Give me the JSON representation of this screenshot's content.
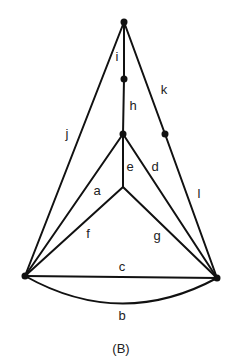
{
  "caption": "(B)",
  "nodes": {
    "top": {
      "x": 124,
      "y": 22,
      "dot": true
    },
    "ih": {
      "x": 124,
      "y": 79,
      "dot": true
    },
    "mid": {
      "x": 123,
      "y": 134,
      "dot": true
    },
    "kl": {
      "x": 165,
      "y": 134,
      "dot": true
    },
    "center": {
      "x": 123,
      "y": 187,
      "dot": false
    },
    "left": {
      "x": 25,
      "y": 276,
      "dot": true
    },
    "right": {
      "x": 217,
      "y": 278,
      "dot": true
    }
  },
  "edges": {
    "i": {
      "label": "i",
      "from": "top",
      "to": "ih"
    },
    "h": {
      "label": "h",
      "from": "ih",
      "to": "mid"
    },
    "j": {
      "label": "j",
      "from": "top",
      "to": "left"
    },
    "k": {
      "label": "k",
      "from": "top",
      "to": "kl"
    },
    "l": {
      "label": "l",
      "from": "kl",
      "to": "right"
    },
    "e": {
      "label": "e",
      "from": "mid",
      "to": "center"
    },
    "a": {
      "label": "a",
      "from": "mid",
      "to": "left"
    },
    "d": {
      "label": "d",
      "from": "mid",
      "to": "right"
    },
    "f": {
      "label": "f",
      "from": "center",
      "to": "left"
    },
    "g": {
      "label": "g",
      "from": "center",
      "to": "right"
    },
    "c": {
      "label": "c",
      "from": "left",
      "to": "right",
      "shape": "straight"
    },
    "b": {
      "label": "b",
      "from": "left",
      "to": "right",
      "shape": "arc"
    }
  }
}
